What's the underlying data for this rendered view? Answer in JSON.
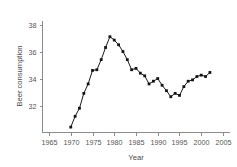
{
  "figure": {
    "clipped_header_text": "· · · ·",
    "background_color": "#ffffff",
    "line_color": "#1a1a1a",
    "marker_color": "#141414",
    "axis_color": "#8c8c8c",
    "text_color": "#4a4a4a"
  },
  "chart_data": {
    "type": "line",
    "title": "",
    "xlabel": "Year",
    "ylabel": "Beer consumption",
    "xlim": [
      1963.5,
      2006.5
    ],
    "ylim": [
      30.0,
      38.3
    ],
    "xticks": [
      1965,
      1970,
      1975,
      1980,
      1985,
      1990,
      1995,
      2000,
      2005
    ],
    "xtick_labels": [
      "1965",
      "1970",
      "1975",
      "1980",
      "1985",
      "1990",
      "1995",
      "2000",
      "2005"
    ],
    "yticks": [
      32,
      34,
      36,
      38
    ],
    "ytick_labels": [
      "32",
      "34",
      "36",
      "38"
    ],
    "grid": false,
    "legend": false,
    "markers": "filled-square",
    "x": [
      1970,
      1971,
      1972,
      1973,
      1974,
      1975,
      1976,
      1977,
      1978,
      1979,
      1980,
      1981,
      1982,
      1983,
      1984,
      1985,
      1986,
      1987,
      1988,
      1989,
      1990,
      1991,
      1992,
      1993,
      1994,
      1995,
      1996,
      1997,
      1998,
      1999,
      2000,
      2001,
      2002
    ],
    "values": [
      30.4,
      31.2,
      31.8,
      32.9,
      33.6,
      34.6,
      34.65,
      35.4,
      36.3,
      37.1,
      36.85,
      36.5,
      36.0,
      35.4,
      34.65,
      34.75,
      34.4,
      34.2,
      33.6,
      33.8,
      34.0,
      33.5,
      33.1,
      32.65,
      32.9,
      32.75,
      33.4,
      33.8,
      33.9,
      34.15,
      34.25,
      34.15,
      34.45
    ],
    "series": [
      {
        "name": "Beer consumption",
        "values": [
          30.4,
          31.2,
          31.8,
          32.9,
          33.6,
          34.6,
          34.65,
          35.4,
          36.3,
          37.1,
          36.85,
          36.5,
          36.0,
          35.4,
          34.65,
          34.75,
          34.4,
          34.2,
          33.6,
          33.8,
          34.0,
          33.5,
          33.1,
          32.65,
          32.9,
          32.75,
          33.4,
          33.8,
          33.9,
          34.15,
          34.25,
          34.15,
          34.45
        ]
      }
    ]
  }
}
